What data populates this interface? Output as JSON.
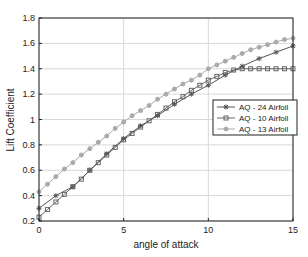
{
  "chart_data": {
    "type": "line",
    "title": "",
    "xlabel": "angle of attack",
    "ylabel": "Lift Coefficient",
    "xlim": [
      0,
      15
    ],
    "ylim": [
      0.2,
      1.8
    ],
    "xticks": [
      0,
      5,
      10,
      15
    ],
    "yticks": [
      0.2,
      0.4,
      0.6,
      0.8,
      1,
      1.2,
      1.4,
      1.6,
      1.8
    ],
    "ytick_labels": [
      "0.2",
      "0.4",
      "0.6",
      "0.8",
      "1",
      "1.2",
      "1.4",
      "1.6",
      "1.8"
    ],
    "grid": true,
    "legend_position": "right-middle",
    "series": [
      {
        "name": "AQ - 24 Airfoil",
        "color": "#555555",
        "marker": "star",
        "x": [
          0,
          1,
          2,
          3,
          4,
          5,
          6,
          7,
          8,
          9,
          10,
          11,
          12,
          13,
          14,
          15
        ],
        "values": [
          0.3,
          0.4,
          0.47,
          0.6,
          0.73,
          0.85,
          0.95,
          1.03,
          1.12,
          1.2,
          1.27,
          1.35,
          1.42,
          1.48,
          1.53,
          1.58
        ]
      },
      {
        "name": "AQ - 10 Airfoil",
        "color": "#666666",
        "marker": "square",
        "x": [
          0,
          0.5,
          1,
          1.5,
          2,
          2.5,
          3,
          3.5,
          4,
          4.5,
          5,
          5.5,
          6,
          6.5,
          7,
          7.5,
          8,
          8.5,
          9,
          9.5,
          10,
          10.5,
          11,
          11.5,
          12,
          12.5,
          13,
          13.5,
          14,
          14.5,
          15
        ],
        "values": [
          0.23,
          0.29,
          0.35,
          0.41,
          0.47,
          0.53,
          0.6,
          0.66,
          0.72,
          0.78,
          0.84,
          0.89,
          0.94,
          0.99,
          1.04,
          1.09,
          1.14,
          1.18,
          1.23,
          1.27,
          1.31,
          1.34,
          1.37,
          1.39,
          1.4,
          1.4,
          1.4,
          1.4,
          1.4,
          1.4,
          1.4
        ]
      },
      {
        "name": "AQ - 13 Airfoil",
        "color": "#aaaaaa",
        "marker": "circle",
        "x": [
          0,
          0.5,
          1,
          1.5,
          2,
          2.5,
          3,
          3.5,
          4,
          4.5,
          5,
          5.5,
          6,
          6.5,
          7,
          7.5,
          8,
          8.5,
          9,
          9.5,
          10,
          10.5,
          11,
          11.5,
          12,
          12.5,
          13,
          13.5,
          14,
          14.5,
          15
        ],
        "values": [
          0.43,
          0.49,
          0.55,
          0.61,
          0.66,
          0.72,
          0.77,
          0.82,
          0.87,
          0.93,
          0.98,
          1.03,
          1.07,
          1.11,
          1.16,
          1.2,
          1.24,
          1.28,
          1.31,
          1.35,
          1.4,
          1.43,
          1.46,
          1.49,
          1.52,
          1.55,
          1.57,
          1.59,
          1.61,
          1.63,
          1.64
        ]
      }
    ]
  }
}
